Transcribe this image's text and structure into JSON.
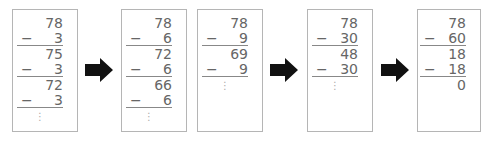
{
  "diagram": {
    "boxes": [
      {
        "rows": [
          {
            "type": "num",
            "value": "78"
          },
          {
            "type": "sub",
            "value": "3"
          },
          {
            "type": "num",
            "value": "75"
          },
          {
            "type": "sub",
            "value": "3"
          },
          {
            "type": "num",
            "value": "72"
          },
          {
            "type": "sub",
            "value": "3"
          }
        ],
        "ellipsis": "⋮"
      },
      {
        "rows": [
          {
            "type": "num",
            "value": "78"
          },
          {
            "type": "sub",
            "value": "6"
          },
          {
            "type": "num",
            "value": "72"
          },
          {
            "type": "sub",
            "value": "6"
          },
          {
            "type": "num",
            "value": "66"
          },
          {
            "type": "sub",
            "value": "6"
          }
        ],
        "ellipsis": "⋮"
      },
      {
        "rows": [
          {
            "type": "num",
            "value": "78"
          },
          {
            "type": "sub",
            "value": "9"
          },
          {
            "type": "num",
            "value": "69"
          },
          {
            "type": "sub",
            "value": "9"
          }
        ],
        "ellipsis": "⋮"
      },
      {
        "rows": [
          {
            "type": "num",
            "value": "78"
          },
          {
            "type": "sub",
            "value": "30"
          },
          {
            "type": "num",
            "value": "48"
          },
          {
            "type": "sub",
            "value": "30"
          }
        ],
        "ellipsis": "⋮"
      },
      {
        "rows": [
          {
            "type": "num",
            "value": "78"
          },
          {
            "type": "sub",
            "value": "60"
          },
          {
            "type": "num",
            "value": "18"
          },
          {
            "type": "sub",
            "value": "18"
          },
          {
            "type": "num",
            "value": "0"
          }
        ],
        "ellipsis": ""
      }
    ],
    "minus_sign": "−",
    "arrow_icon": "right-arrow-icon",
    "colors": {
      "text": "#666666",
      "border": "#b5b5b5",
      "rule": "#888888",
      "arrow": "#111111"
    }
  }
}
